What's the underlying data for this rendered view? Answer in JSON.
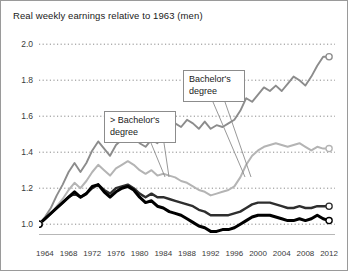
{
  "chart": {
    "title": "Real weekly earnings relative to 1963 (men)"
  },
  "annotations": {
    "above_bachelors": "> Bachelor's degree",
    "bachelors": "Bachelor's degree"
  },
  "chart_data": {
    "type": "line",
    "title": "Real weekly earnings relative to 1963 (men)",
    "xlabel": "",
    "ylabel": "",
    "xlim": [
      1963,
      2013
    ],
    "ylim": [
      0.94,
      2.04
    ],
    "grid": true,
    "legend_position": "annotations-inline",
    "yticks": [
      1.0,
      1.2,
      1.4,
      1.6,
      1.8,
      2.0
    ],
    "ytick_labels": [
      "1.0",
      "1.2",
      "1.4",
      "1.6",
      "1.8",
      "2.0"
    ],
    "xticks": [
      1964,
      1968,
      1972,
      1976,
      1980,
      1984,
      1988,
      1992,
      1996,
      2000,
      2004,
      2008,
      2012
    ],
    "xtick_labels": [
      "1964",
      "1968",
      "1972",
      "1976",
      "1980",
      "1984",
      "1988",
      "1992",
      "1996",
      "2000",
      "2004",
      "2008",
      "2012"
    ],
    "x": [
      1963,
      1964,
      1965,
      1966,
      1967,
      1968,
      1969,
      1970,
      1971,
      1972,
      1973,
      1974,
      1975,
      1976,
      1977,
      1978,
      1979,
      1980,
      1981,
      1982,
      1983,
      1984,
      1985,
      1986,
      1987,
      1988,
      1989,
      1990,
      1991,
      1992,
      1993,
      1994,
      1995,
      1996,
      1997,
      1998,
      1999,
      2000,
      2001,
      2002,
      2003,
      2004,
      2005,
      2006,
      2007,
      2008,
      2009,
      2010,
      2011,
      2012
    ],
    "series": [
      {
        "name": "> Bachelor's degree",
        "color": "#8c8c8c",
        "width": 1.9,
        "end_marker": true,
        "end_value": 1.93,
        "values": [
          1.0,
          1.04,
          1.09,
          1.16,
          1.22,
          1.29,
          1.34,
          1.29,
          1.34,
          1.41,
          1.46,
          1.42,
          1.38,
          1.44,
          1.47,
          1.51,
          1.49,
          1.45,
          1.43,
          1.47,
          1.45,
          1.49,
          1.52,
          1.56,
          1.54,
          1.58,
          1.56,
          1.53,
          1.57,
          1.53,
          1.55,
          1.54,
          1.56,
          1.58,
          1.63,
          1.7,
          1.68,
          1.72,
          1.76,
          1.74,
          1.77,
          1.74,
          1.78,
          1.82,
          1.8,
          1.77,
          1.82,
          1.88,
          1.93,
          1.93
        ]
      },
      {
        "name": "Bachelor's degree",
        "color": "#b4b4b4",
        "width": 2.0,
        "end_marker": true,
        "end_value": 1.42,
        "values": [
          1.0,
          1.03,
          1.06,
          1.1,
          1.14,
          1.19,
          1.23,
          1.2,
          1.24,
          1.29,
          1.33,
          1.3,
          1.27,
          1.31,
          1.33,
          1.35,
          1.33,
          1.3,
          1.28,
          1.3,
          1.27,
          1.28,
          1.27,
          1.26,
          1.24,
          1.23,
          1.21,
          1.19,
          1.18,
          1.16,
          1.17,
          1.18,
          1.19,
          1.21,
          1.26,
          1.33,
          1.38,
          1.41,
          1.43,
          1.44,
          1.45,
          1.44,
          1.43,
          1.44,
          1.45,
          1.43,
          1.41,
          1.43,
          1.42,
          1.42
        ]
      },
      {
        "name": "Some college / associate",
        "color": "#2e2e2e",
        "width": 2.4,
        "end_marker": true,
        "end_value": 1.1,
        "values": [
          1.0,
          1.03,
          1.06,
          1.09,
          1.12,
          1.15,
          1.17,
          1.15,
          1.17,
          1.2,
          1.22,
          1.19,
          1.17,
          1.2,
          1.21,
          1.22,
          1.2,
          1.17,
          1.15,
          1.17,
          1.15,
          1.15,
          1.14,
          1.13,
          1.12,
          1.11,
          1.1,
          1.08,
          1.07,
          1.05,
          1.05,
          1.05,
          1.05,
          1.06,
          1.07,
          1.09,
          1.11,
          1.12,
          1.12,
          1.12,
          1.11,
          1.1,
          1.09,
          1.09,
          1.1,
          1.09,
          1.09,
          1.1,
          1.1,
          1.1
        ]
      },
      {
        "name": "High school or less",
        "color": "#000000",
        "width": 3.0,
        "end_marker": true,
        "end_value": 1.02,
        "values": [
          1.0,
          1.03,
          1.06,
          1.09,
          1.12,
          1.15,
          1.18,
          1.15,
          1.17,
          1.21,
          1.22,
          1.18,
          1.15,
          1.18,
          1.2,
          1.21,
          1.19,
          1.15,
          1.12,
          1.13,
          1.1,
          1.09,
          1.07,
          1.06,
          1.05,
          1.03,
          1.01,
          0.99,
          0.98,
          0.96,
          0.96,
          0.97,
          0.97,
          0.98,
          1.0,
          1.02,
          1.04,
          1.05,
          1.05,
          1.05,
          1.04,
          1.03,
          1.02,
          1.02,
          1.03,
          1.02,
          1.03,
          1.05,
          1.03,
          1.02
        ]
      }
    ]
  }
}
